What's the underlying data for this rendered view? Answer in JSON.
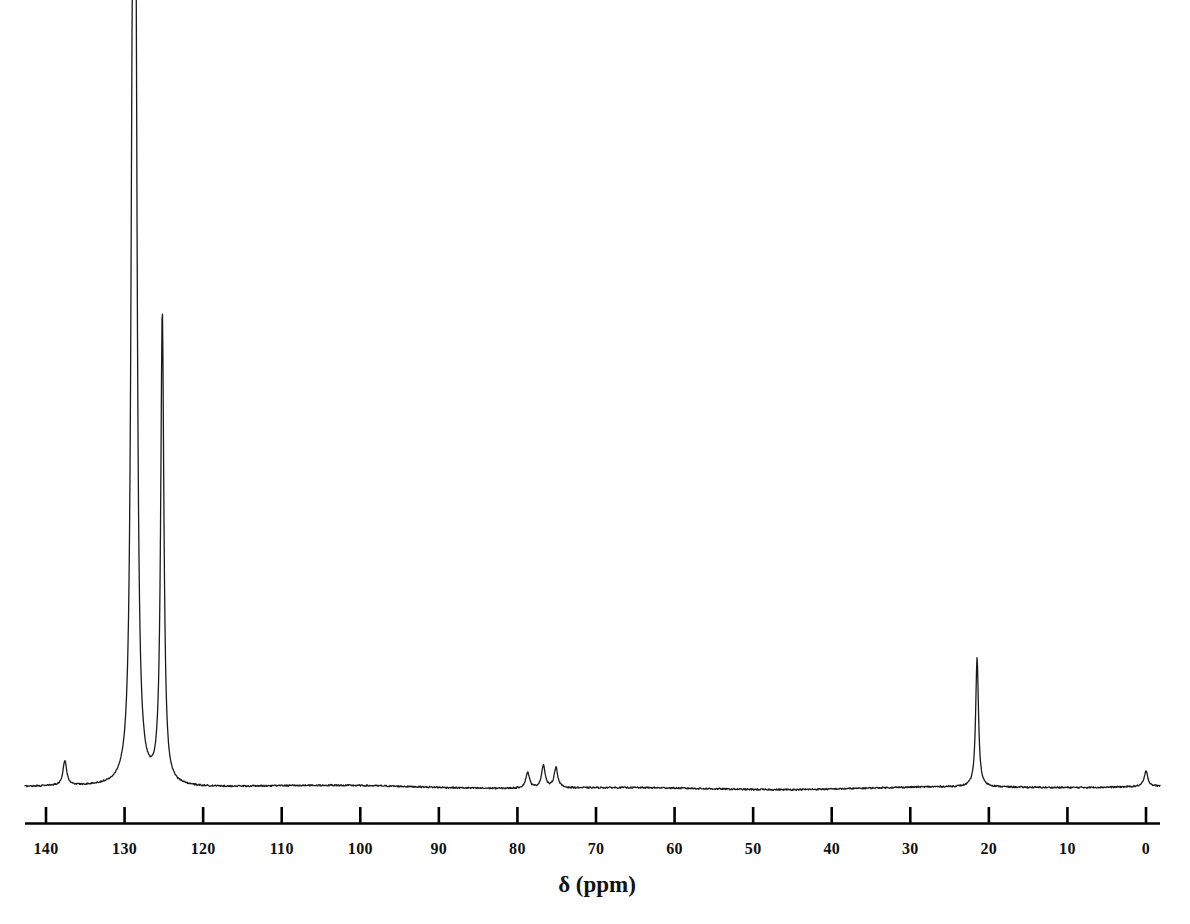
{
  "chart_data": {
    "type": "line",
    "title": "",
    "subtitle": "",
    "xlabel": "δ (ppm)",
    "ylabel": "",
    "grid": false,
    "legend": null,
    "axis_direction": "reversed",
    "xlim": [
      143.0,
      -2.0
    ],
    "ylim": [
      0,
      1
    ],
    "tick_labels": [
      "140",
      "130",
      "120",
      "110",
      "100",
      "90",
      "80",
      "70",
      "60",
      "50",
      "40",
      "30",
      "20",
      "10",
      "0"
    ],
    "tick_values": [
      140,
      130,
      120,
      110,
      100,
      90,
      80,
      70,
      60,
      50,
      40,
      30,
      20,
      10,
      0
    ],
    "baseline_noise": true,
    "peaks": [
      {
        "ppm": 137.6,
        "intensity": 0.033,
        "label": ""
      },
      {
        "ppm": 129.0,
        "intensity": 0.808,
        "label": ""
      },
      {
        "ppm": 128.6,
        "intensity": 1.0,
        "label": ""
      },
      {
        "ppm": 125.2,
        "intensity": 0.623,
        "label": ""
      },
      {
        "ppm": 78.7,
        "intensity": 0.021,
        "label": ""
      },
      {
        "ppm": 76.7,
        "intensity": 0.03,
        "label": ""
      },
      {
        "ppm": 75.1,
        "intensity": 0.027,
        "label": ""
      },
      {
        "ppm": 21.5,
        "intensity": 0.17,
        "label": ""
      },
      {
        "ppm": 0.0,
        "intensity": 0.02,
        "label": ""
      }
    ]
  },
  "axis": {
    "title": "δ (ppm)",
    "labels": [
      "140",
      "130",
      "120",
      "110",
      "100",
      "90",
      "80",
      "70",
      "60",
      "50",
      "40",
      "30",
      "20",
      "10",
      "0"
    ]
  },
  "colors": {
    "trace": "#1a1a1a",
    "axis": "#000000",
    "background": "#ffffff",
    "text": "#111111"
  }
}
